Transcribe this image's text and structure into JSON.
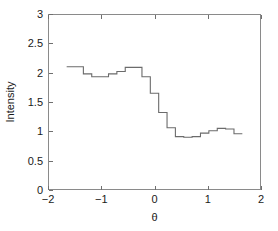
{
  "chart_data": {
    "type": "line",
    "title": "",
    "xlabel": "θ",
    "ylabel": "Intensity",
    "xlim": [
      -2,
      2
    ],
    "ylim": [
      0,
      3
    ],
    "xticks": [
      -2,
      -1,
      0,
      1,
      2
    ],
    "xticklabels": [
      "−2",
      "−1",
      "0",
      "1",
      "2"
    ],
    "yticks": [
      0,
      0.5,
      1,
      1.5,
      2,
      2.5,
      3
    ],
    "yticklabels": [
      "0",
      "0.5",
      "1",
      "1.5",
      "2",
      "2.5",
      "3"
    ],
    "grid": false,
    "legend": false,
    "drawstyle": "steps-post",
    "line_color": "#6b6b6b",
    "axis_color": "#8a8a8a",
    "text_color": "#1a1a1a",
    "series": [
      {
        "name": "Intensity",
        "x": [
          -1.571,
          -1.414,
          -1.257,
          -1.1,
          -0.942,
          -0.785,
          -0.628,
          -0.471,
          -0.314,
          -0.157,
          0.0,
          0.157,
          0.314,
          0.471,
          0.628,
          0.785,
          0.942,
          1.1,
          1.257,
          1.414,
          1.571
        ],
        "values": [
          2.1,
          2.1,
          1.98,
          1.93,
          1.93,
          1.98,
          2.02,
          2.09,
          2.09,
          1.93,
          1.65,
          1.32,
          1.06,
          0.91,
          0.9,
          0.91,
          0.97,
          1.01,
          1.05,
          1.04,
          0.96
        ]
      }
    ]
  },
  "figure": {
    "background": "#ffffff",
    "plot_left_px": 48,
    "plot_right_px": 261,
    "plot_top_px": 14,
    "plot_bottom_px": 190
  }
}
